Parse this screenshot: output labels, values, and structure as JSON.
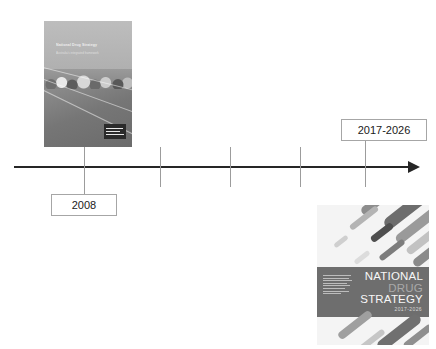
{
  "timeline": {
    "axis_label": "timeline-arrow",
    "ticks": [
      84,
      160,
      230,
      300,
      365
    ],
    "markers": [
      {
        "label": "2008",
        "position": "below-left"
      },
      {
        "label": "2017-2026",
        "position": "above-right"
      }
    ]
  },
  "covers": {
    "first": {
      "name": "national-drug-strategy-2004-2009-cover",
      "title_line": "National Drug Strategy",
      "subtitle_line": "Australia's integrated framework",
      "logo_label": "government-crest"
    },
    "second": {
      "name": "national-drug-strategy-2017-2026-cover",
      "heading_line1": "NATIONAL",
      "heading_line2": "DRUG",
      "heading_line3": "STRATEGY",
      "years": "2017-2026"
    }
  }
}
